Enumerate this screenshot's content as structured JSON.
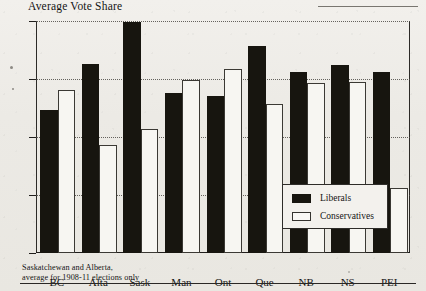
{
  "chart_data": {
    "type": "bar",
    "title": "Average Vote Share",
    "xlabel": "",
    "ylabel": "",
    "ylim": [
      20,
      60
    ],
    "yticks": [
      20,
      30,
      40,
      50,
      60
    ],
    "grid": true,
    "legend_position": "inside-bottom-right",
    "categories": [
      "BC",
      "Alta",
      "Sask",
      "Man",
      "Ont",
      "Que",
      "NB",
      "NS",
      "PEI"
    ],
    "series": [
      {
        "name": "Liberals",
        "color": "#17150f",
        "values": [
          44.3,
          52.2,
          59.4,
          47.2,
          46.8,
          55.3,
          50.9,
          52.1,
          50.9
        ]
      },
      {
        "name": "Conservatives",
        "color": "#f7f6f2",
        "values": [
          47.7,
          38.3,
          41.1,
          49.4,
          51.3,
          45.4,
          49.0,
          49.2,
          30.8
        ]
      }
    ],
    "footnote": [
      "Saskatchewan and Alberta,",
      "average for 1908-11 elections only"
    ]
  },
  "axis": {
    "tick_labels": [
      "60",
      "50",
      "40",
      "30",
      "20"
    ]
  },
  "legend": {
    "items": [
      {
        "label": "Liberals",
        "swatch": "filled-black-swatch"
      },
      {
        "label": "Conservatives",
        "swatch": "outlined-white-swatch"
      }
    ]
  }
}
